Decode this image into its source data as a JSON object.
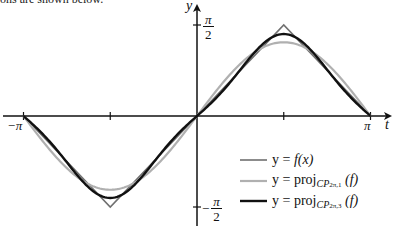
{
  "caption_fragment": "ons are shown below.",
  "axes": {
    "x_label": "t",
    "y_label": "y",
    "x_ticks": [
      {
        "value": -3.14159,
        "label": "−π"
      },
      {
        "value": -1.5708,
        "label": ""
      },
      {
        "value": 1.5708,
        "label": ""
      },
      {
        "value": 3.14159,
        "label": "π"
      }
    ],
    "y_ticks": [
      {
        "value": 1.5708,
        "label_num": "π",
        "label_den": "2",
        "sign": ""
      },
      {
        "value": -1.5708,
        "label_num": "π",
        "label_den": "2",
        "sign": "−"
      }
    ]
  },
  "legend": [
    {
      "name": "f",
      "prefix": "y = ",
      "text": "f(x)",
      "color": "#707070",
      "width": 1.6
    },
    {
      "name": "proj1",
      "prefix": "y = ",
      "text": "proj",
      "sub": "CP",
      "subsub": "2π,1",
      "arg": "(f)",
      "color": "#b0b0b0",
      "width": 2.2
    },
    {
      "name": "proj3",
      "prefix": "y = ",
      "text": "proj",
      "sub": "CP",
      "subsub": "2π,3",
      "arg": "(f)",
      "color": "#111111",
      "width": 2.4
    }
  ],
  "chart_data": {
    "type": "line",
    "title": "",
    "xlabel": "t",
    "ylabel": "y",
    "xlim": [
      -3.14159,
      3.14159
    ],
    "ylim": [
      -1.5708,
      1.5708
    ],
    "grid": false,
    "legend_position": "lower right",
    "x_tick_labels": [
      "−π",
      "π"
    ],
    "y_tick_labels": [
      "π/2",
      "−π/2"
    ],
    "series": [
      {
        "name": "y = f(x)",
        "description": "triangle wave: x for |x|≤π/2, π−x for x>π/2, −π−x for x<−π/2",
        "color": "#707070",
        "x": [
          -3.14159,
          -1.5708,
          0,
          1.5708,
          3.14159
        ],
        "y": [
          0,
          -1.5708,
          0,
          1.5708,
          0
        ]
      },
      {
        "name": "y = proj_{CP_{2π,1}}(f)",
        "description": "(4/π) sin t",
        "color": "#b0b0b0",
        "coeffs": [
          {
            "n": 1,
            "b": 1.2732
          }
        ],
        "x": [
          -3.14159,
          -2.3562,
          -1.5708,
          -0.7854,
          0,
          0.7854,
          1.5708,
          2.3562,
          3.14159
        ],
        "y": [
          0,
          -0.9003,
          -1.2732,
          -0.9003,
          0,
          0.9003,
          1.2732,
          0.9003,
          0
        ]
      },
      {
        "name": "y = proj_{CP_{2π,3}}(f)",
        "description": "(4/π) sin t − (4/(9π)) sin 3t",
        "color": "#111111",
        "coeffs": [
          {
            "n": 1,
            "b": 1.2732
          },
          {
            "n": 3,
            "b": -0.1415
          }
        ],
        "x": [
          -3.14159,
          -2.3562,
          -1.5708,
          -0.7854,
          0,
          0.7854,
          1.5708,
          2.3562,
          3.14159
        ],
        "y": [
          0,
          -0.8003,
          -1.4147,
          -0.8003,
          0,
          0.8003,
          1.4147,
          0.8003,
          0
        ]
      }
    ]
  }
}
